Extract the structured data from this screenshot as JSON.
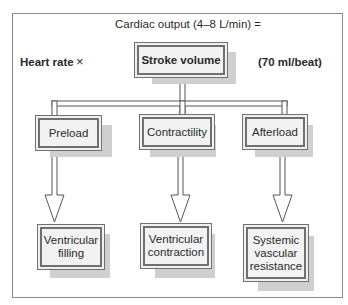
{
  "title": "Cardiac output (4–8 L/min) =",
  "left_factor": "Heart rate",
  "operator": "×",
  "main_box": "Stroke volume",
  "main_value": "(70 ml/beat)",
  "determinants": [
    {
      "label": "Preload",
      "effect": "Ventricular filling"
    },
    {
      "label": "Contractility",
      "effect": "Ventricular contraction"
    },
    {
      "label": "Afterload",
      "effect": "Systemic vascular resistance"
    }
  ],
  "effect_lines": [
    [
      "Ventricular",
      "filling"
    ],
    [
      "Ventricular",
      "contraction"
    ],
    [
      "Systemic",
      "vascular",
      "resistance"
    ]
  ]
}
